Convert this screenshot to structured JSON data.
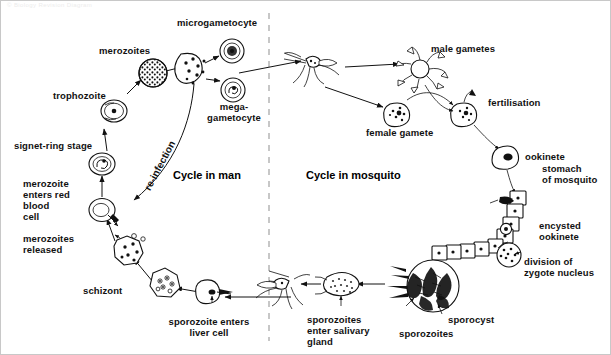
{
  "figure": {
    "watermark": "© Biology Revision Diagram",
    "sections": {
      "man": "Cycle in man",
      "mosquito": "Cycle in mosquito"
    },
    "reinfection_label": "re-infection",
    "divider": {
      "style": "dashed",
      "orientation": "vertical",
      "color": "#9a9a9a"
    }
  },
  "labels": {
    "merozoites": "merozoites",
    "trophozoite": "trophozoite",
    "signet_ring_stage": "signet-ring stage",
    "merozoite_enters_red_blood_cell": "merozoite\nenters red\nblood\ncell",
    "merozoites_released": "merozoites\nreleased",
    "schizont": "schizont",
    "sporozoite_enters_liver_cell": "sporozoite enters\nliver cell",
    "microgametocyte": "microgametocyte",
    "mega_gametocyte": "mega-\ngametocyte",
    "male_gametes": "male gametes",
    "female_gamete": "female gamete",
    "fertilisation": "fertilisation",
    "ookinete": "ookinete",
    "stomach_of_mosquito": "stomach\nof mosquito",
    "encysted_ookinete": "encysted\nookinete",
    "division_of_zygote_nucleus": "division of\nzygote nucleus",
    "sporocyst": "sporocyst",
    "sporozoites": "sporozoites",
    "sporozoites_enter_salivary_gland": "sporozoites\nenter salivary\ngland"
  },
  "stages": [
    {
      "name": "merozoites",
      "side": "man"
    },
    {
      "name": "trophozoite",
      "side": "man"
    },
    {
      "name": "signet-ring stage",
      "side": "man"
    },
    {
      "name": "merozoite enters red blood cell",
      "side": "man"
    },
    {
      "name": "merozoites released",
      "side": "man"
    },
    {
      "name": "schizont",
      "side": "man"
    },
    {
      "name": "sporozoite enters liver cell",
      "side": "man"
    },
    {
      "name": "microgametocyte",
      "side": "man"
    },
    {
      "name": "mega-gametocyte",
      "side": "man"
    },
    {
      "name": "male gametes",
      "side": "mosquito"
    },
    {
      "name": "female gamete",
      "side": "mosquito"
    },
    {
      "name": "fertilisation",
      "side": "mosquito"
    },
    {
      "name": "ookinete",
      "side": "mosquito"
    },
    {
      "name": "encysted ookinete",
      "side": "mosquito"
    },
    {
      "name": "division of zygote nucleus",
      "side": "mosquito"
    },
    {
      "name": "sporocyst",
      "side": "mosquito"
    },
    {
      "name": "sporozoites",
      "side": "mosquito"
    },
    {
      "name": "sporozoites enter salivary gland",
      "side": "mosquito"
    }
  ],
  "colors": {
    "ink": "#111111",
    "paper": "#ffffff",
    "divider": "#9a9a9a",
    "border": "#c8c8c8"
  }
}
